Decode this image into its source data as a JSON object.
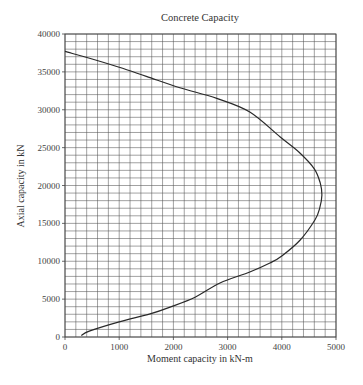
{
  "chart_data": {
    "type": "line",
    "title": "Concrete Capacity",
    "xlabel": "Moment capacity in kN-m",
    "ylabel": "Axial capacity in kN",
    "xlim": [
      0,
      5000
    ],
    "ylim": [
      0,
      40000
    ],
    "x_ticks": [
      0,
      1000,
      2000,
      3000,
      4000,
      5000
    ],
    "y_ticks": [
      0,
      5000,
      10000,
      15000,
      20000,
      25000,
      30000,
      35000,
      40000
    ],
    "x_ticks_labels": [
      "0",
      "1000",
      "2000",
      "3000",
      "4000",
      "5000"
    ],
    "y_ticks_labels": [
      "0",
      "5000",
      "10000",
      "15000",
      "20000",
      "25000",
      "30000",
      "35000",
      "40000"
    ],
    "grid": true,
    "grid_x_step": 200,
    "grid_y_step": 1000,
    "legend": null,
    "series": [
      {
        "name": "Interaction curve",
        "points": [
          [
            300,
            200
          ],
          [
            460,
            800
          ],
          [
            1000,
            2000
          ],
          [
            1570,
            3050
          ],
          [
            1940,
            3950
          ],
          [
            2400,
            5250
          ],
          [
            2860,
            7130
          ],
          [
            3410,
            8580
          ],
          [
            3780,
            9770
          ],
          [
            4000,
            10700
          ],
          [
            4340,
            12800
          ],
          [
            4610,
            15450
          ],
          [
            4700,
            17000
          ],
          [
            4740,
            18750
          ],
          [
            4710,
            20300
          ],
          [
            4600,
            22200
          ],
          [
            4320,
            24400
          ],
          [
            3970,
            26400
          ],
          [
            3410,
            29700
          ],
          [
            2800,
            31500
          ],
          [
            2120,
            32900
          ],
          [
            1500,
            34400
          ],
          [
            1000,
            35600
          ],
          [
            500,
            36700
          ],
          [
            0,
            37700
          ]
        ]
      }
    ]
  }
}
